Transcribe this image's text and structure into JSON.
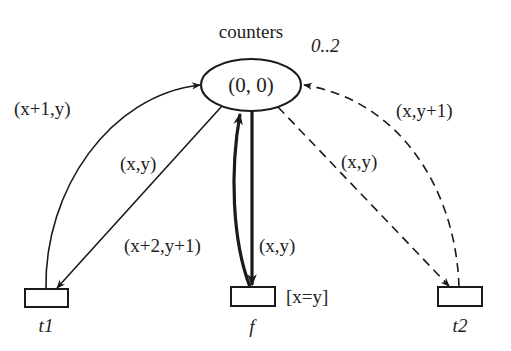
{
  "place": {
    "name": "counters",
    "marking": "(0, 0)",
    "capacity": "0..2"
  },
  "transitions": [
    {
      "id": "t1",
      "label": "t1",
      "guard": ""
    },
    {
      "id": "f",
      "label": "f",
      "guard": "[x=y]"
    },
    {
      "id": "t2",
      "label": "t2",
      "guard": ""
    }
  ],
  "arcs": [
    {
      "from": "t1",
      "to": "counters",
      "inscription": "(x+1,y)",
      "style": "solid"
    },
    {
      "from": "counters",
      "to": "t1",
      "inscription": "(x,y)",
      "style": "solid"
    },
    {
      "from": "f",
      "to": "counters",
      "inscription": "(x+2,y+1)",
      "style": "thick"
    },
    {
      "from": "counters",
      "to": "f",
      "inscription": "(x,y)",
      "style": "thick"
    },
    {
      "from": "counters",
      "to": "t2",
      "inscription": "(x,y)",
      "style": "dashed"
    },
    {
      "from": "t2",
      "to": "counters",
      "inscription": "(x,y+1)",
      "style": "dashed"
    }
  ],
  "colors": {
    "stroke": "#1a1a1a",
    "text": "#222222",
    "background": "#ffffff"
  }
}
